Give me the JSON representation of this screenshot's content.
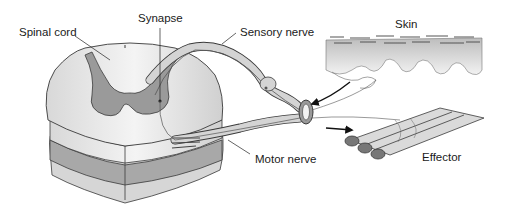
{
  "diagram": {
    "labels": {
      "spinal_cord": "Spinal cord",
      "synapse": "Synapse",
      "sensory_nerve": "Sensory nerve",
      "skin": "Skin",
      "motor_nerve": "Motor nerve",
      "effector": "Effector"
    },
    "colors": {
      "background": "#ffffff",
      "white_matter": "#ececec",
      "gray_matter": "#9a9a9a",
      "nerve": "#c8c8c8",
      "outline": "#3a3a3a",
      "text": "#1a1a1a"
    }
  }
}
